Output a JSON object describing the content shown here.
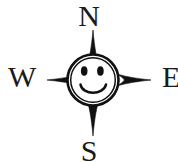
{
  "figure": {
    "background_color": "#ffffff",
    "ink_color": "#1a1a1a",
    "width": 178,
    "height": 162
  },
  "cardinal_points": {
    "north": "N",
    "west": "W",
    "east": "E",
    "south": "S"
  },
  "compass": {
    "center_x": 93,
    "center_y": 80,
    "star_points": 4,
    "north_tip_y": 30,
    "south_tip_y": 136,
    "west_tip_x": 47,
    "east_tip_x": 151,
    "face_radius": 25,
    "face_fill": "#ffffff",
    "stroke_color": "#111111"
  },
  "face": {
    "left_eye": {
      "cx": 84,
      "cy": 71,
      "rx": 3.2,
      "ry": 4.6
    },
    "right_eye": {
      "cx": 100,
      "cy": 71,
      "rx": 3.2,
      "ry": 4.6
    },
    "smile_label": "smile"
  }
}
